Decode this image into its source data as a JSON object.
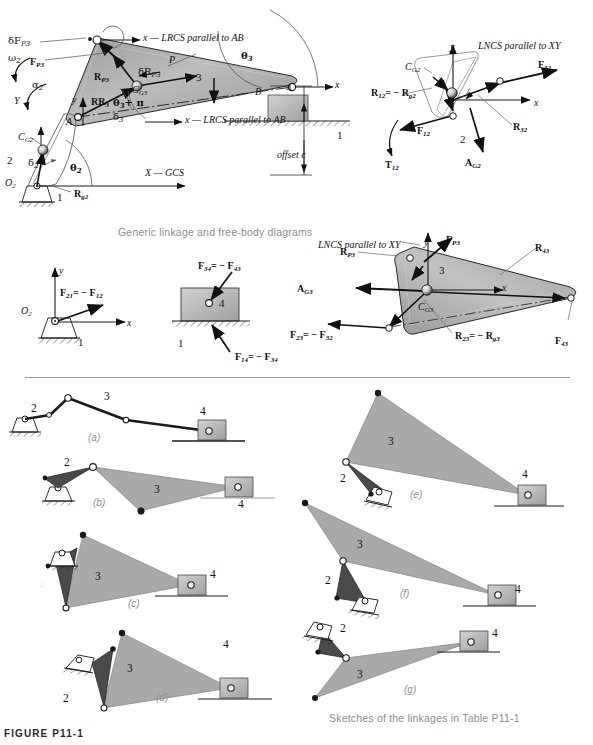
{
  "figure": {
    "id_label": "FIGURE P11-1",
    "caption_top": "Generic linkage and free-body diagrams",
    "caption_bottom": "Sketches of the linkages in Table P11-1"
  },
  "colors": {
    "link3_fill": "#a9a9a9",
    "link2_fill": "#4a4a4a",
    "slider_fill": "#b4b4b4",
    "outline": "#1a1a1a",
    "caption_gray": "#8c8c8c",
    "part_label_gray": "#8f8f8f",
    "divider_gray": "#9a9a9a"
  },
  "main_diagram": {
    "name": "generic-linkage-diagram",
    "annotations": {
      "lrcs_ab_top": "x — LRCS parallel to AB",
      "lrcs_ab_bottom": "x — LRCS parallel to AB",
      "gcs": "X — GCS",
      "offset": "offset c",
      "theta3": "θ3",
      "theta3_pi": "θ3 + π",
      "theta2": "θ2",
      "omega2": "ω2",
      "alpha2": "α2",
      "delta2": "δ2",
      "delta3": "δ3",
      "delta_FP3": "δFP3",
      "delta_RP3": "δRP3",
      "F_P3": "FP3",
      "R_P3": "RP3",
      "R_R3": "RR3",
      "R_g2": "Rg2",
      "CG2": "CG2",
      "CG3": "CG3",
      "point_P": "P",
      "point_A": "A",
      "point_B": "B",
      "point_O2": "O2",
      "axis_y_small": "y",
      "axis_Y_global": "Y",
      "link1_a": "1",
      "link1_b": "1",
      "link2": "2",
      "link3": "3",
      "link4": "4"
    }
  },
  "fbd_link2": {
    "name": "free-body-diagram-link-2",
    "annotations": {
      "lncs": "LNCS parallel to XY",
      "axis_y": "y",
      "axis_x": "x",
      "CG2": "CG2",
      "R12": "R12 = − Rg2",
      "R32": "R32",
      "F32": "F32",
      "F12": "F12",
      "T12": "T12",
      "A_G2": "AG2",
      "link_number": "2"
    }
  },
  "fbd_link3": {
    "name": "free-body-diagram-link-3",
    "annotations": {
      "lncs": "LNCS parallel to XY",
      "axis_y": "y",
      "axis_x": "x",
      "CG3": "CG3",
      "F_P3": "FP3",
      "R_P3": "RP3",
      "R_43": "R43",
      "R_23": "R23 = − Rg3",
      "F_23": "F23 = − F32",
      "F_43": "F43",
      "A_G3": "AG3",
      "link_number": "3"
    }
  },
  "fbd_link1_ground": {
    "name": "free-body-diagram-ground-link",
    "annotations": {
      "axis_y": "y",
      "axis_x": "x",
      "O2": "O2",
      "F21": "F21 = − F12",
      "link_number": "1"
    }
  },
  "fbd_link4_slider": {
    "name": "free-body-diagram-link-4",
    "annotations": {
      "F34": "F34 = − F43",
      "F14": "F14 = − F34",
      "link_number_4": "4",
      "link_number_1": "1"
    }
  },
  "sketches": [
    {
      "key": "a",
      "part_label": "(a)",
      "links": [
        "2",
        "3",
        "4"
      ],
      "type": "pin-jointed-bar-linkage"
    },
    {
      "key": "b",
      "part_label": "(b)",
      "links": [
        "2",
        "3",
        "4"
      ],
      "type": "triangular-coupler-slider"
    },
    {
      "key": "c",
      "part_label": "(c)",
      "links": [
        "2",
        "3",
        "4"
      ],
      "type": "triangular-coupler-slider"
    },
    {
      "key": "d",
      "part_label": "(d)",
      "links": [
        "2",
        "3",
        "4"
      ],
      "type": "triangular-coupler-slider"
    },
    {
      "key": "e",
      "part_label": "(e)",
      "links": [
        "2",
        "3",
        "4"
      ],
      "type": "triangular-coupler-slider"
    },
    {
      "key": "f",
      "part_label": "(f)",
      "links": [
        "2",
        "3",
        "4"
      ],
      "type": "triangular-coupler-slider"
    },
    {
      "key": "g",
      "part_label": "(g)",
      "links": [
        "2",
        "3",
        "4"
      ],
      "type": "triangular-coupler-slider"
    }
  ]
}
